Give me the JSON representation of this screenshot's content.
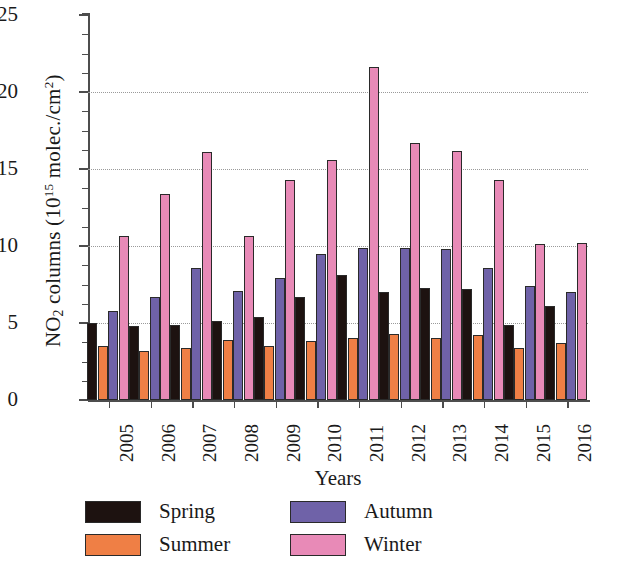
{
  "chart_data": {
    "type": "bar",
    "title": "",
    "xlabel": "Years",
    "ylabel": "NO2 columns (10^15 molec./cm^2)",
    "ylabel_parts": {
      "pre": "NO",
      "sub": "2",
      "mid": " columns (10",
      "sup": "15",
      "post": " molec./cm",
      "sup2": "2",
      "end": ")"
    },
    "categories": [
      "2005",
      "2006",
      "2007",
      "2008",
      "2009",
      "2010",
      "2011",
      "2012",
      "2013",
      "2014",
      "2015",
      "2016"
    ],
    "series": [
      {
        "name": "Spring",
        "color": "#1d1210",
        "values": [
          5.0,
          4.8,
          4.9,
          5.1,
          5.4,
          6.7,
          8.1,
          7.0,
          7.3,
          7.2,
          4.9,
          6.1
        ]
      },
      {
        "name": "Summer",
        "color": "#ef7f45",
        "values": [
          3.5,
          3.2,
          3.4,
          3.9,
          3.5,
          3.8,
          4.0,
          4.3,
          4.0,
          4.2,
          3.4,
          3.7
        ]
      },
      {
        "name": "Autumn",
        "color": "#6f62a8",
        "values": [
          5.8,
          6.7,
          8.6,
          7.1,
          7.9,
          9.5,
          9.9,
          9.9,
          9.8,
          8.6,
          7.4,
          7.0
        ]
      },
      {
        "name": "Winter",
        "color": "#e88ab7",
        "values": [
          10.65,
          13.4,
          16.1,
          10.65,
          14.3,
          15.6,
          21.6,
          16.7,
          16.2,
          14.3,
          10.1,
          10.2
        ]
      }
    ],
    "ylim": [
      0,
      25
    ],
    "yticks": [
      0,
      5,
      10,
      15,
      20,
      25
    ],
    "ytick_labels": [
      "0",
      "5",
      "10",
      "15",
      "20",
      "25"
    ],
    "yminor_step": 1.25,
    "grid": "horizontal-dotted",
    "legend_position": "bottom",
    "legend_entries": [
      "Spring",
      "Summer",
      "Autumn",
      "Winter"
    ]
  }
}
